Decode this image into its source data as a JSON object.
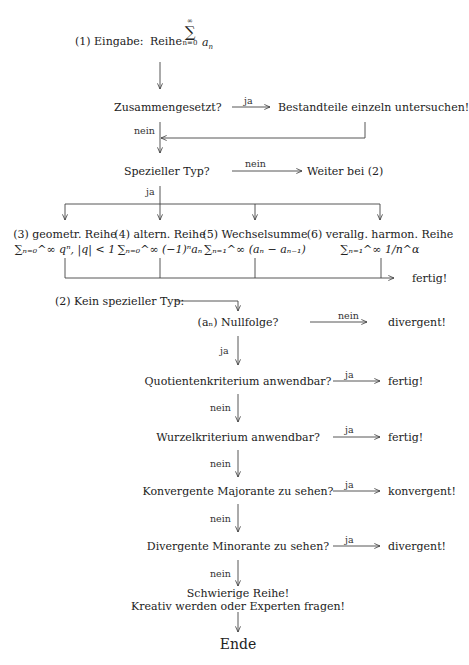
{
  "start": {
    "prefix": "(1) Eingabe:",
    "word": "Reihe",
    "sum_symbol": "∑",
    "upper": "∞",
    "lower": "n=0",
    "term": "a",
    "term_sub": "n"
  },
  "step1": {
    "question": "Zusammengesetzt?",
    "yes_label": "ja",
    "yes_result": "Bestandteile einzeln untersuchen!",
    "no_label": "nein"
  },
  "step2": {
    "question": "Spezieller Typ?",
    "no_label": "nein",
    "no_result": "Weiter bei (2)",
    "yes_label": "ja"
  },
  "special_types": [
    {
      "title": "(3) geometr. Reihe",
      "formula": "∑ₙ₌₀^∞ qⁿ, |q| < 1"
    },
    {
      "title": "(4) altern. Reihe",
      "formula": "∑ₙ₌₀^∞ (−1)ⁿaₙ"
    },
    {
      "title": "(5) Wechselsumme",
      "formula": "∑ₙ₌₁^∞ (aₙ − aₙ₋₁)"
    },
    {
      "title": "(6) verallg. harmon. Reihe",
      "formula": "∑ₙ₌₁^∞ 1/n^α"
    }
  ],
  "special_done": "fertig!",
  "part2": {
    "heading": "(2) Kein spezieller Typ:",
    "steps": [
      {
        "question": "(aₙ) Nullfolge?",
        "side_label": "nein",
        "side_result": "divergent!",
        "down_label": "ja"
      },
      {
        "question": "Quotientenkriterium anwendbar?",
        "side_label": "ja",
        "side_result": "fertig!",
        "down_label": "nein"
      },
      {
        "question": "Wurzelkriterium anwendbar?",
        "side_label": "ja",
        "side_result": "fertig!",
        "down_label": "nein"
      },
      {
        "question": "Konvergente Majorante zu sehen?",
        "side_label": "ja",
        "side_result": "konvergent!",
        "down_label": "nein"
      },
      {
        "question": "Divergente Minorante zu sehen?",
        "side_label": "ja",
        "side_result": "divergent!",
        "down_label": "nein"
      }
    ],
    "final_line1": "Schwierige Reihe!",
    "final_line2": "Kreativ werden oder Experten fragen!",
    "end": "Ende"
  }
}
